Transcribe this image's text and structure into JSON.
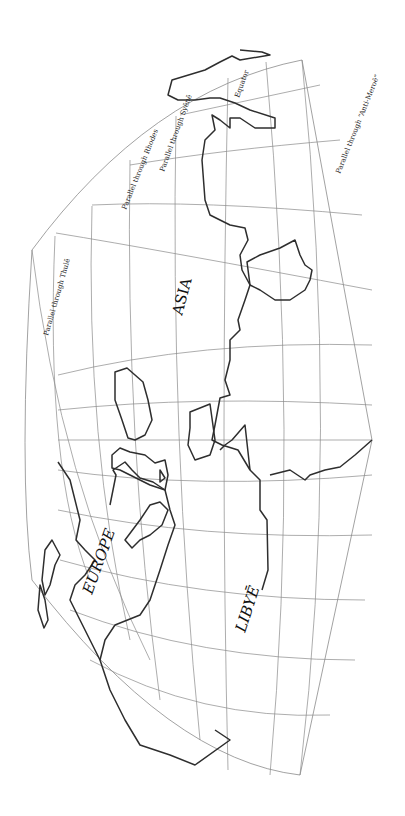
{
  "map": {
    "regions": {
      "asia": "ASIA",
      "europe": "EUROPE",
      "libye": "LIBYĒ"
    },
    "parallels": {
      "thule": "Parallel through Thulē",
      "rhodes": "Parallel through Rhodes",
      "syene": "Parallel through Syēnē",
      "equator": "Equator",
      "anti_meroe": "Parallel through “Anti-Meroē”"
    },
    "colors": {
      "background": "#ffffff",
      "grid": "#8a8a8a",
      "coastline": "#2e2e2e",
      "text": "#111111"
    }
  }
}
